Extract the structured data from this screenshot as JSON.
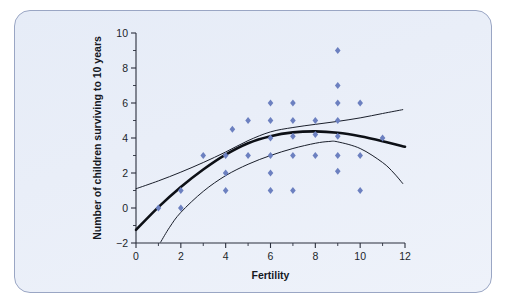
{
  "figure": {
    "panel_name": "chart-panel",
    "background_color": "#e9eef8",
    "border_color": "#9aa6c4"
  },
  "chart_data": {
    "type": "scatter",
    "title": "",
    "subtitle": "",
    "xlabel": "Fertility",
    "ylabel": "Number of children surviving to 10 years",
    "xlim": [
      0,
      12
    ],
    "ylim": [
      -2,
      10
    ],
    "x_ticks_major": [
      0,
      2,
      4,
      6,
      8,
      10,
      12
    ],
    "x_tick_labels": [
      "0",
      "2",
      "4",
      "6",
      "8",
      "10",
      "12"
    ],
    "x_ticks_minor": [
      1,
      3,
      5,
      7,
      9,
      11
    ],
    "y_ticks_major": [
      -2,
      0,
      2,
      4,
      6,
      8,
      10
    ],
    "y_tick_labels": [
      "−2",
      "0",
      "2",
      "4",
      "6",
      "8",
      "10"
    ],
    "y_ticks_minor": [
      -1,
      1,
      3,
      5,
      7,
      9
    ],
    "grid": false,
    "legend": null,
    "legend_position": "none",
    "marker_color": "#6c80c0",
    "marker_shape": "diamond",
    "points": [
      {
        "x": 1,
        "y": 0
      },
      {
        "x": 2,
        "y": 1
      },
      {
        "x": 2,
        "y": 0
      },
      {
        "x": 3,
        "y": 3
      },
      {
        "x": 4,
        "y": 3
      },
      {
        "x": 4,
        "y": 2
      },
      {
        "x": 4,
        "y": 1
      },
      {
        "x": 4.3,
        "y": 4.5
      },
      {
        "x": 5,
        "y": 5
      },
      {
        "x": 5,
        "y": 3
      },
      {
        "x": 6,
        "y": 6
      },
      {
        "x": 6,
        "y": 5
      },
      {
        "x": 6,
        "y": 4
      },
      {
        "x": 6,
        "y": 3
      },
      {
        "x": 6,
        "y": 2
      },
      {
        "x": 6,
        "y": 1
      },
      {
        "x": 7,
        "y": 6
      },
      {
        "x": 7,
        "y": 5
      },
      {
        "x": 7,
        "y": 4.1
      },
      {
        "x": 7,
        "y": 3
      },
      {
        "x": 7,
        "y": 1
      },
      {
        "x": 8,
        "y": 5
      },
      {
        "x": 8,
        "y": 4.2
      },
      {
        "x": 8,
        "y": 3
      },
      {
        "x": 9,
        "y": 9
      },
      {
        "x": 9,
        "y": 7
      },
      {
        "x": 9,
        "y": 6
      },
      {
        "x": 9,
        "y": 5
      },
      {
        "x": 9,
        "y": 4.1
      },
      {
        "x": 9,
        "y": 3
      },
      {
        "x": 9,
        "y": 2.1
      },
      {
        "x": 10,
        "y": 6
      },
      {
        "x": 10,
        "y": 3
      },
      {
        "x": 10,
        "y": 1
      },
      {
        "x": 11,
        "y": 4
      }
    ],
    "curves": [
      {
        "name": "fitted-quadratic",
        "style": "thick",
        "color": "#0d1016",
        "x_range": [
          0,
          12
        ],
        "points": [
          {
            "x": 0.0,
            "y": -1.25
          },
          {
            "x": 1.0,
            "y": 0.05
          },
          {
            "x": 2.0,
            "y": 1.2
          },
          {
            "x": 3.0,
            "y": 2.2
          },
          {
            "x": 4.0,
            "y": 3.05
          },
          {
            "x": 5.0,
            "y": 3.7
          },
          {
            "x": 6.0,
            "y": 4.1
          },
          {
            "x": 7.0,
            "y": 4.32
          },
          {
            "x": 8.0,
            "y": 4.38
          },
          {
            "x": 9.0,
            "y": 4.3
          },
          {
            "x": 10.0,
            "y": 4.1
          },
          {
            "x": 11.0,
            "y": 3.82
          },
          {
            "x": 12.0,
            "y": 3.5
          }
        ]
      },
      {
        "name": "upper-confidence-band",
        "style": "thin",
        "color": "#1a1f2b",
        "x_range": [
          0,
          11.9
        ],
        "points": [
          {
            "x": 0.0,
            "y": 1.1
          },
          {
            "x": 1.0,
            "y": 1.55
          },
          {
            "x": 2.0,
            "y": 2.05
          },
          {
            "x": 3.0,
            "y": 2.6
          },
          {
            "x": 4.0,
            "y": 3.2
          },
          {
            "x": 5.0,
            "y": 3.85
          },
          {
            "x": 6.0,
            "y": 4.35
          },
          {
            "x": 7.0,
            "y": 4.6
          },
          {
            "x": 8.0,
            "y": 4.78
          },
          {
            "x": 9.0,
            "y": 4.95
          },
          {
            "x": 10.0,
            "y": 5.15
          },
          {
            "x": 11.0,
            "y": 5.4
          },
          {
            "x": 11.9,
            "y": 5.62
          }
        ]
      },
      {
        "name": "lower-confidence-band",
        "style": "thin",
        "color": "#1a1f2b",
        "x_range": [
          1.1,
          11.9
        ],
        "points": [
          {
            "x": 1.1,
            "y": -1.95
          },
          {
            "x": 1.5,
            "y": -1.1
          },
          {
            "x": 2.0,
            "y": -0.25
          },
          {
            "x": 3.0,
            "y": 0.95
          },
          {
            "x": 4.0,
            "y": 1.85
          },
          {
            "x": 5.0,
            "y": 2.5
          },
          {
            "x": 6.0,
            "y": 3.0
          },
          {
            "x": 7.0,
            "y": 3.4
          },
          {
            "x": 8.0,
            "y": 3.7
          },
          {
            "x": 8.6,
            "y": 3.8
          },
          {
            "x": 9.0,
            "y": 3.78
          },
          {
            "x": 10.0,
            "y": 3.4
          },
          {
            "x": 11.0,
            "y": 2.6
          },
          {
            "x": 11.5,
            "y": 2.0
          },
          {
            "x": 11.9,
            "y": 1.4
          }
        ]
      }
    ]
  }
}
